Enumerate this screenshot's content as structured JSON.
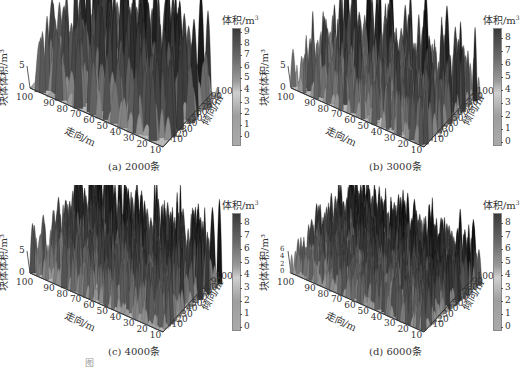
{
  "chart_data": [
    {
      "type": "surface3d",
      "panel": "a",
      "caption": "(a) 2000条",
      "zlabel": "块体体积/m³",
      "xlabel": "走向/m",
      "ylabel": "倾向/m",
      "z_ticks": [
        "0",
        "5"
      ],
      "x_ticks": [
        "100",
        "90",
        "80",
        "70",
        "60",
        "50",
        "40",
        "30",
        "20",
        "10"
      ],
      "y_ticks": [
        "10",
        "20",
        "30",
        "40",
        "50",
        "60",
        "70",
        "80",
        "90",
        "100"
      ],
      "colorbar_title": "体积/m³",
      "colorbar_ticks": [
        "9",
        "8",
        "7",
        "6",
        "5",
        "4",
        "3",
        "2",
        "1",
        "0"
      ],
      "colorbar_range": [
        0,
        9
      ]
    },
    {
      "type": "surface3d",
      "panel": "b",
      "caption": "(b) 3000条",
      "zlabel": "块体体积/m³",
      "xlabel": "走向/m",
      "ylabel": "倾向/m",
      "z_ticks": [
        "0",
        "5"
      ],
      "x_ticks": [
        "100",
        "90",
        "80",
        "70",
        "60",
        "50",
        "40",
        "30",
        "20",
        "10"
      ],
      "y_ticks": [
        "10",
        "20",
        "30",
        "40",
        "50",
        "60",
        "70",
        "80",
        "90",
        "100"
      ],
      "colorbar_title": "体积/m³",
      "colorbar_ticks": [
        "8",
        "7",
        "6",
        "5",
        "4",
        "3",
        "2",
        "1",
        "0"
      ],
      "colorbar_range": [
        0,
        8
      ]
    },
    {
      "type": "surface3d",
      "panel": "c",
      "caption": "(c) 4000条",
      "zlabel": "块体体积/m³",
      "xlabel": "走向/m",
      "ylabel": "倾向/m",
      "z_ticks": [
        "0",
        "5"
      ],
      "x_ticks": [
        "100",
        "90",
        "80",
        "70",
        "60",
        "50",
        "40",
        "30",
        "20",
        "10"
      ],
      "y_ticks": [
        "10",
        "20",
        "30",
        "40",
        "50",
        "60",
        "70",
        "80",
        "90",
        "100"
      ],
      "colorbar_title": "体积/m³",
      "colorbar_ticks": [
        "8",
        "7",
        "6",
        "5",
        "4",
        "3",
        "2",
        "1",
        "0"
      ],
      "colorbar_range": [
        0,
        8
      ]
    },
    {
      "type": "surface3d",
      "panel": "d",
      "caption": "(d) 6000条",
      "zlabel": "块体体积/m³",
      "xlabel": "走向/m",
      "ylabel": "倾向/m",
      "z_ticks": [
        "0",
        "2",
        "4",
        "6"
      ],
      "x_ticks": [
        "100",
        "90",
        "80",
        "70",
        "60",
        "50",
        "40",
        "30",
        "20",
        "10"
      ],
      "y_ticks": [
        "10",
        "20",
        "30",
        "40",
        "50",
        "60",
        "70",
        "80",
        "90",
        "100"
      ],
      "colorbar_title": "体积/m³",
      "colorbar_ticks": [
        "8",
        "7",
        "6",
        "5",
        "4",
        "3",
        "2",
        "1",
        "0"
      ],
      "colorbar_range": [
        0,
        8
      ]
    }
  ],
  "panels": {
    "a": {
      "caption": "(a) 2000条"
    },
    "b": {
      "caption": "(b) 3000条"
    },
    "c": {
      "caption": "(c) 4000条"
    },
    "d": {
      "caption": "(d) 6000条"
    }
  },
  "labels": {
    "cb_title": "体积/m",
    "cb_sup": "3",
    "zlabel": "块体体积/m³",
    "xlabel": "走向/m",
    "ylabel": "倾向/m"
  },
  "figure_caption": "图"
}
